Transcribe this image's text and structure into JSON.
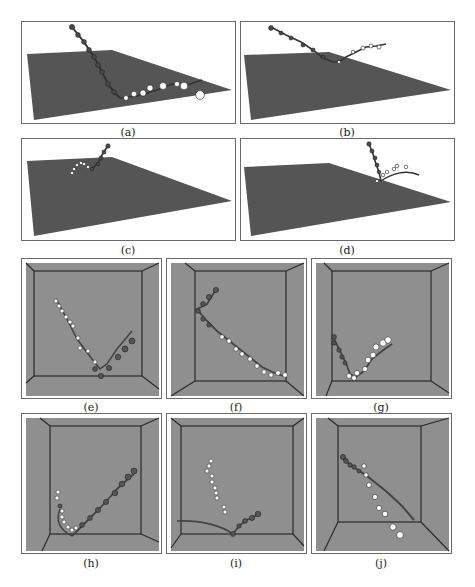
{
  "figure": {
    "panels": [
      {
        "id": "a",
        "caption": "(a)",
        "view": "perspective-plane"
      },
      {
        "id": "b",
        "caption": "(b)",
        "view": "perspective-plane"
      },
      {
        "id": "c",
        "caption": "(c)",
        "view": "perspective-plane"
      },
      {
        "id": "d",
        "caption": "(d)",
        "view": "perspective-plane"
      },
      {
        "id": "e",
        "caption": "(e)",
        "view": "box-room"
      },
      {
        "id": "f",
        "caption": "(f)",
        "view": "box-room"
      },
      {
        "id": "g",
        "caption": "(g)",
        "view": "box-room"
      },
      {
        "id": "h",
        "caption": "(h)",
        "view": "box-room"
      },
      {
        "id": "i",
        "caption": "(i)",
        "view": "box-room"
      },
      {
        "id": "j",
        "caption": "(j)",
        "view": "box-room"
      }
    ],
    "colors": {
      "plane": "#555555",
      "room_floor": "#8f8f8f",
      "room_edges": "#2b2b2b",
      "dark_marker": "#4a4a4a",
      "light_marker": "#ffffff",
      "frame": "#6a6a6a"
    }
  }
}
